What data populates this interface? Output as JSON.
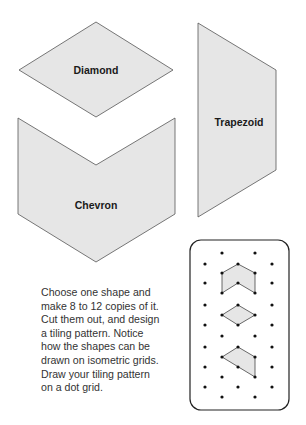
{
  "shapes": {
    "fill": "#e6e6e6",
    "stroke": "#555555",
    "diamond": {
      "label": "Diamond",
      "points": "96,22 173,70 96,117 19,70",
      "label_pos": [
        96,
        74
      ]
    },
    "trapezoid": {
      "label": "Trapezoid",
      "points": "198,23 276,70 276,170 198,217",
      "label_pos": [
        239,
        126
      ]
    },
    "chevron": {
      "label": "Chevron",
      "points": "18,118 96,165 175,118 175,214 96,262 18,214",
      "label_pos": [
        96,
        209
      ]
    }
  },
  "instructions": {
    "lines": [
      "Choose one shape and",
      "make 8 to 12 copies of it.",
      "Cut them out, and design",
      "a tiling pattern. Notice",
      "how the shapes can be",
      "drawn on isometric grids.",
      "Draw your tiling pattern",
      "on a dot grid."
    ]
  },
  "dot_grid": {
    "frame": {
      "x": 190,
      "y": 240,
      "w": 99,
      "h": 170,
      "r": 11
    },
    "columns": [
      205,
      222,
      238,
      255,
      272
    ],
    "rows": [
      253,
      264,
      273,
      283,
      293,
      305,
      315,
      325,
      336,
      347,
      357,
      367,
      377,
      387,
      397
    ],
    "mini_shapes": [
      {
        "name": "chevron",
        "points": "238,264 255,273 255,293 238,283 222,293 222,273"
      },
      {
        "name": "diamond",
        "points": "238,305 255,315 238,325 222,315"
      },
      {
        "name": "trapezoid",
        "points": "238,347 255,357 255,377 222,357"
      }
    ]
  }
}
